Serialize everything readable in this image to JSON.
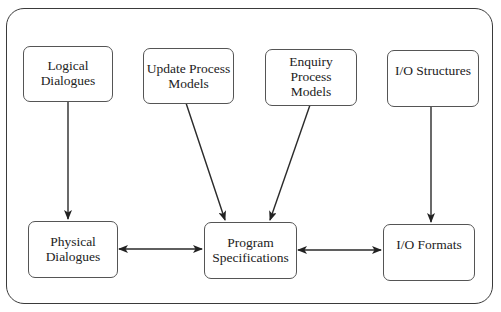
{
  "diagram": {
    "type": "flow",
    "nodes": [
      {
        "id": "logical_dialogues",
        "label": "Logical\nDialogues",
        "row": "top"
      },
      {
        "id": "update_process_models",
        "label": "Update Process\nModels",
        "row": "top"
      },
      {
        "id": "enquiry_process_models",
        "label": "Enquiry\nProcess\nModels",
        "row": "top"
      },
      {
        "id": "io_structures",
        "label": "I/O Structures",
        "row": "top"
      },
      {
        "id": "physical_dialogues",
        "label": "Physical\nDialogues",
        "row": "bottom"
      },
      {
        "id": "program_specifications",
        "label": "Program\nSpecifications",
        "row": "bottom"
      },
      {
        "id": "io_formats",
        "label": "I/O Formats",
        "row": "bottom"
      }
    ],
    "edges": [
      {
        "from": "logical_dialogues",
        "to": "physical_dialogues",
        "direction": "one-way"
      },
      {
        "from": "update_process_models",
        "to": "program_specifications",
        "direction": "one-way"
      },
      {
        "from": "enquiry_process_models",
        "to": "program_specifications",
        "direction": "one-way"
      },
      {
        "from": "io_structures",
        "to": "io_formats",
        "direction": "one-way"
      },
      {
        "from": "physical_dialogues",
        "to": "program_specifications",
        "direction": "bidirectional"
      },
      {
        "from": "program_specifications",
        "to": "io_formats",
        "direction": "bidirectional"
      }
    ],
    "colors": {
      "stroke": "#333333",
      "background": "#ffffff",
      "text": "#222222"
    }
  }
}
